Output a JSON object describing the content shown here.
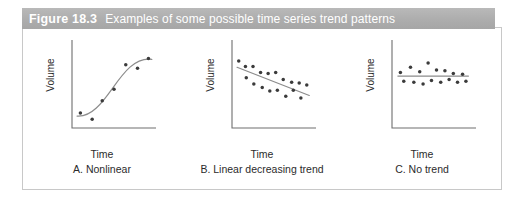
{
  "figure": {
    "number_label": "Figure 18.3",
    "title": "Examples of some possible time series trend patterns",
    "header_bg": "#adadad",
    "header_text_color": "#ffffff",
    "body_border_color": "#c8c8c8",
    "body_bg": "#ffffff"
  },
  "chart_data": [
    {
      "type": "scatter",
      "id": "panel-a",
      "title": "A. Nonlinear",
      "xlabel": "Time",
      "ylabel": "Volume",
      "grid": false,
      "legend": "none",
      "axis_color": "#6e6e6e",
      "point_color": "#3b3b3b",
      "trend_color": "#8c8c8c",
      "trend_kind": "s-curve",
      "xlim": [
        0,
        10
      ],
      "ylim": [
        0,
        10
      ],
      "x": [
        1.0,
        2.4,
        3.6,
        5.0,
        6.4,
        7.8,
        9.1
      ],
      "y": [
        1.7,
        1.0,
        3.1,
        4.4,
        7.2,
        6.8,
        7.9
      ]
    },
    {
      "type": "scatter",
      "id": "panel-b",
      "title": "B. Linear decreasing trend",
      "xlabel": "Time",
      "ylabel": "Volume",
      "grid": false,
      "legend": "none",
      "axis_color": "#6e6e6e",
      "point_color": "#3b3b3b",
      "trend_color": "#8c8c8c",
      "trend_kind": "linear-decreasing",
      "xlim": [
        0,
        10
      ],
      "ylim": [
        0,
        10
      ],
      "x": [
        0.8,
        1.6,
        1.7,
        2.5,
        2.6,
        3.4,
        3.6,
        4.3,
        4.5,
        5.2,
        5.4,
        6.1,
        6.4,
        7.1,
        7.3,
        8.0,
        8.2,
        8.9
      ],
      "y": [
        7.6,
        7.0,
        5.7,
        7.0,
        5.0,
        6.3,
        4.6,
        6.2,
        4.2,
        6.3,
        4.3,
        5.5,
        3.6,
        5.2,
        4.3,
        5.1,
        3.4,
        4.9
      ],
      "trend_line": {
        "x0": 0.6,
        "y0": 6.9,
        "x1": 9.2,
        "y1": 3.7
      }
    },
    {
      "type": "scatter",
      "id": "panel-c",
      "title": "C. No trend",
      "xlabel": "Time",
      "ylabel": "Volume",
      "grid": false,
      "legend": "none",
      "axis_color": "#6e6e6e",
      "point_color": "#3b3b3b",
      "trend_color": "#8c8c8c",
      "trend_kind": "flat",
      "xlim": [
        0,
        10
      ],
      "ylim": [
        0,
        10
      ],
      "x": [
        1.0,
        1.4,
        2.2,
        2.6,
        3.3,
        3.7,
        4.3,
        4.7,
        5.3,
        5.8,
        6.3,
        6.8,
        7.3,
        7.8,
        8.4,
        8.8
      ],
      "y": [
        6.3,
        5.3,
        6.9,
        5.2,
        6.4,
        5.0,
        7.4,
        5.4,
        6.6,
        5.2,
        6.5,
        5.5,
        6.2,
        5.2,
        6.1,
        5.3
      ],
      "trend_line": {
        "x0": 0.7,
        "y0": 5.9,
        "x1": 9.1,
        "y1": 5.9
      }
    }
  ]
}
